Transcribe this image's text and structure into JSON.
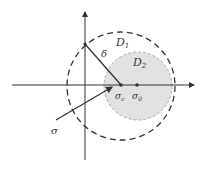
{
  "diagram": {
    "labels": {
      "d1": "D",
      "d1_sub": "1",
      "d2": "D",
      "d2_sub": "2",
      "delta": "δ",
      "sigma": "σ",
      "sigma_c": "σ",
      "sigma_c_sub": "c",
      "sigma_0": "σ",
      "sigma_0_sub": "0"
    },
    "colors": {
      "axis": "#333333",
      "d2_fill": "#e0e0e0",
      "d2_stroke": "#999999",
      "d1_stroke": "#333333"
    }
  }
}
